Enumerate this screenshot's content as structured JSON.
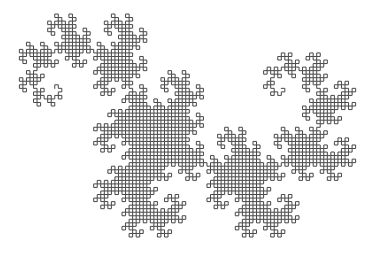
{
  "figure": {
    "type": "fractal-curve",
    "caption": "",
    "background_color": "#ffffff",
    "canvas": {
      "width": 371,
      "height": 253
    }
  },
  "chart_data": {
    "type": "line",
    "subtitle": "",
    "xlabel": "",
    "ylabel": "",
    "grid": false,
    "legend": null,
    "axes_visible": false,
    "tick_labels": [],
    "annotations": [],
    "fractal": {
      "name": "Heighway dragon",
      "family": "dragon-curve",
      "construction": "L-system",
      "order": 12,
      "segment_count": 4096,
      "turn_angle_degrees": 90,
      "initial_heading_degrees": 0,
      "axiom": "FX",
      "rules": {
        "X": "X+YF+",
        "Y": "-FX-Y"
      },
      "fold_sequence_rule": "paper-folding / regular paperfolding sequence",
      "hausdorff_dimension": 2,
      "self_similar": true,
      "space_filling": true,
      "plane_tiling": true
    },
    "style": {
      "stroke_color": "#474747",
      "stroke_width": 1,
      "stroke_linecap": "square",
      "stroke_linejoin": "miter",
      "fill": "none"
    },
    "geometry": {
      "cell_size_px": 6.6,
      "bounding_box_px": {
        "x_min": 19,
        "y_min": 14,
        "x_max": 356,
        "y_max": 237,
        "width": 337,
        "height": 223
      },
      "grid_extent_cells": {
        "width": 51,
        "height": 34
      },
      "start_point_px": [
        228,
        149
      ],
      "end_point_px": [
        149,
        149
      ]
    },
    "xlim": [
      0,
      371
    ],
    "ylim": [
      0,
      253
    ]
  }
}
